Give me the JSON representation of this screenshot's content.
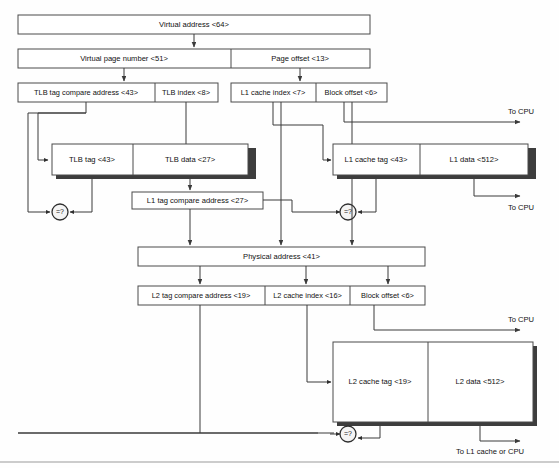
{
  "diagram": {
    "colors": {
      "box_stroke": "#4a4a4a",
      "box_fill": "#ffffff",
      "shadow": "#3d3d3d",
      "line": "#3a3a3a",
      "text": "#111111"
    },
    "rows": {
      "virtual_address": {
        "label": "Virtual address <64>"
      },
      "split1": {
        "virtual_page_number": "Virtual page number <51>",
        "page_offset": "Page offset  <13>"
      },
      "split2": {
        "tlb_tag_compare_address": "TLB tag compare address <43>",
        "tlb_index": "TLB index <8>",
        "l1_cache_index": "L1 cache index <7>",
        "block_offset": "Block offset  <6>"
      },
      "tlb": {
        "tag": "TLB tag <43>",
        "data": "TLB data <27>"
      },
      "l1_cache": {
        "tag": "L1 cache tag <43>",
        "data": "L1 data <512>"
      },
      "l1_tag_compare_address": "L1 tag compare address <27>",
      "physical_address": "Physical address <41>",
      "split3": {
        "l2_tag_compare_address": "L2 tag compare address <19>",
        "l2_cache_index": "L2 cache index <16>",
        "block_offset": "Block offset  <6>"
      },
      "l2_cache": {
        "tag": "L2 cache tag <19>",
        "data": "L2 data <512>"
      }
    },
    "comparators": {
      "tlb_compare": "=?",
      "l1_compare": "=?",
      "l2_compare": "=?"
    },
    "annotations": {
      "to_cpu_1": "To CPU",
      "to_cpu_2": "To CPU",
      "to_cpu_3": "To CPU",
      "to_l1_or_cpu": "To L1 cache or CPU"
    }
  }
}
